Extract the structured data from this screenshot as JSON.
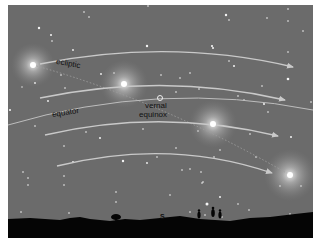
{
  "diagram": {
    "labels": {
      "ecliptic": "ecliptic",
      "equator": "equator",
      "vernal_line1": "vernal",
      "vernal_line2": "equinox",
      "direction": "S"
    },
    "colors": {
      "sky": "#6b6b6b",
      "arc": "#c9c9c9",
      "ground": "#050505",
      "sun": "#ffffff",
      "border": "#ffffff"
    },
    "suns": [
      {
        "x": 33,
        "y": 65
      },
      {
        "x": 124,
        "y": 84
      },
      {
        "x": 213,
        "y": 124
      },
      {
        "x": 290,
        "y": 175
      }
    ],
    "vernal_equinox_point": {
      "x": 160,
      "y": 98
    },
    "daily_paths_with_arrows": 4,
    "equator_has_arrow": false,
    "ground_figures": [
      "tree",
      "person",
      "person",
      "person"
    ]
  }
}
